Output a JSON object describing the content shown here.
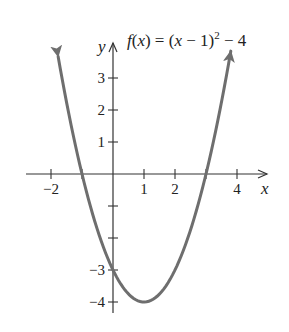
{
  "chart_data": {
    "type": "line",
    "title_parts": {
      "f": "f",
      "x1": "x",
      "mid": ") = (",
      "x2": "x",
      "minus1": " − 1)",
      "exp": "2",
      "tail": " − 4",
      "open": "("
    },
    "function": "(x - 1)^2 - 4",
    "xlabel": "x",
    "ylabel": "y",
    "xlim": [
      -2.8,
      4.9
    ],
    "ylim": [
      -4.4,
      4.2
    ],
    "x_ticks": [
      -2,
      -1,
      1,
      2,
      3,
      4
    ],
    "x_tick_labels": [
      {
        "value": -2,
        "label": "−2"
      },
      {
        "value": 1,
        "label": "1"
      },
      {
        "value": 2,
        "label": "2"
      },
      {
        "value": 4,
        "label": "4"
      }
    ],
    "y_ticks": [
      3,
      2,
      1,
      -1,
      -2,
      -3,
      -4
    ],
    "y_tick_labels": [
      {
        "value": 3,
        "label": "3"
      },
      {
        "value": 2,
        "label": "2"
      },
      {
        "value": 1,
        "label": "1"
      },
      {
        "value": -3,
        "label": "−3"
      },
      {
        "value": -4,
        "label": "−4"
      }
    ],
    "series": [
      {
        "name": "f(x)",
        "x": [
          -1.77,
          -1.5,
          -1,
          -0.5,
          0,
          0.5,
          1,
          1.5,
          2,
          2.5,
          3,
          3.5,
          3.8
        ],
        "values": [
          3.67,
          2.25,
          0,
          -1.75,
          -3,
          -3.75,
          -4,
          -3.75,
          -3,
          -1.75,
          0,
          2.25,
          3.84
        ]
      }
    ],
    "key_points": {
      "vertex": [
        1,
        -4
      ],
      "y_intercept": [
        0,
        -3
      ],
      "x_intercepts": [
        [
          -1,
          0
        ],
        [
          3,
          0
        ]
      ]
    },
    "curve_arrows": "both ends",
    "grid": false,
    "legend": "none",
    "colors": {
      "curve": "#6e6e6e",
      "axis": "#333333",
      "text": "#222222",
      "background": "#ffffff"
    }
  }
}
